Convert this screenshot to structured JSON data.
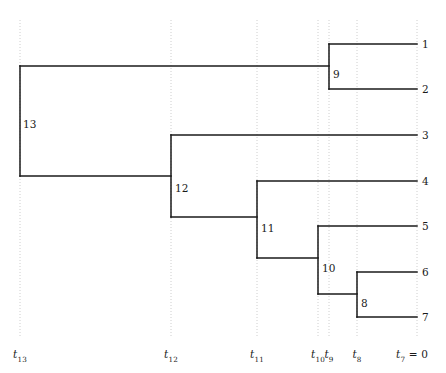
{
  "figure": {
    "type": "phylogenetic-tree",
    "width": 446,
    "height": 373,
    "background_color": "#ffffff",
    "branch_color": "#1a1a1a",
    "gridline_color": "#c8c8c8",
    "text_color": "#1a1a1a"
  },
  "chart_data": {
    "type": "diagram",
    "subtype": "coalescent-phylogenetic-tree",
    "title": "",
    "xlabel": "",
    "ylabel": "",
    "orientation": "left-to-right, time decreasing toward the right",
    "grid": true,
    "legend": false,
    "axis_ticks": [
      {
        "id": "t13",
        "label": "t",
        "sub": "13",
        "extra": "",
        "x": 20
      },
      {
        "id": "t12",
        "label": "t",
        "sub": "12",
        "extra": "",
        "x": 171
      },
      {
        "id": "t11",
        "label": "t",
        "sub": "11",
        "extra": "",
        "x": 257
      },
      {
        "id": "t10",
        "label": "t",
        "sub": "10",
        "extra": "",
        "x": 318
      },
      {
        "id": "t9",
        "label": "t",
        "sub": "9",
        "extra": "",
        "x": 329
      },
      {
        "id": "t8",
        "label": "t",
        "sub": "8",
        "extra": "",
        "x": 357
      },
      {
        "id": "t7",
        "label": "t",
        "sub": "7",
        "extra": " = 0",
        "x": 417
      }
    ],
    "tips": [
      {
        "name": "1",
        "y": 44,
        "parent": "9",
        "x_start": 329,
        "x_end": 417
      },
      {
        "name": "2",
        "y": 89,
        "parent": "9",
        "x_start": 329,
        "x_end": 417
      },
      {
        "name": "3",
        "y": 135,
        "parent": "12",
        "x_start": 171,
        "x_end": 417
      },
      {
        "name": "4",
        "y": 181,
        "parent": "11",
        "x_start": 257,
        "x_end": 417
      },
      {
        "name": "5",
        "y": 226,
        "parent": "10",
        "x_start": 318,
        "x_end": 417
      },
      {
        "name": "6",
        "y": 272,
        "parent": "8",
        "x_start": 357,
        "x_end": 417
      },
      {
        "name": "7",
        "y": 317,
        "parent": "8",
        "x_start": 357,
        "x_end": 417
      }
    ],
    "internal_nodes": [
      {
        "name": "13",
        "time_tick": "t13",
        "x": 20,
        "y_top": 66,
        "y_bottom": 176,
        "children": [
          "9",
          "12"
        ],
        "label_x": 23,
        "label_y": 118
      },
      {
        "name": "12",
        "time_tick": "t12",
        "x": 171,
        "y_top": 135,
        "y_bottom": 217,
        "children": [
          "3",
          "11"
        ],
        "label_x": 175,
        "label_y": 182
      },
      {
        "name": "11",
        "time_tick": "t11",
        "x": 257,
        "y_top": 181,
        "y_bottom": 258,
        "children": [
          "4",
          "10"
        ],
        "label_x": 261,
        "label_y": 222
      },
      {
        "name": "10",
        "time_tick": "t10",
        "x": 318,
        "y_top": 226,
        "y_bottom": 294,
        "children": [
          "5",
          "8"
        ],
        "label_x": 322,
        "label_y": 262
      },
      {
        "name": "9",
        "time_tick": "t9",
        "x": 329,
        "y_top": 44,
        "y_bottom": 89,
        "children": [
          "1",
          "2"
        ],
        "label_x": 333,
        "label_y": 68
      },
      {
        "name": "8",
        "time_tick": "t8",
        "x": 357,
        "y_top": 272,
        "y_bottom": 317,
        "children": [
          "6",
          "7"
        ],
        "label_x": 361,
        "label_y": 297
      }
    ],
    "branches": [
      {
        "from_node": "13",
        "to": "9",
        "y": 66,
        "x_start": 20,
        "x_end": 329
      },
      {
        "from_node": "13",
        "to": "12",
        "y": 176,
        "x_start": 20,
        "x_end": 171
      },
      {
        "from_node": "12",
        "to": "3",
        "y": 135,
        "x_start": 171,
        "x_end": 417
      },
      {
        "from_node": "12",
        "to": "11",
        "y": 217,
        "x_start": 171,
        "x_end": 257
      },
      {
        "from_node": "11",
        "to": "4",
        "y": 181,
        "x_start": 257,
        "x_end": 417
      },
      {
        "from_node": "11",
        "to": "10",
        "y": 258,
        "x_start": 257,
        "x_end": 318
      },
      {
        "from_node": "10",
        "to": "5",
        "y": 226,
        "x_start": 318,
        "x_end": 417
      },
      {
        "from_node": "10",
        "to": "8",
        "y": 294,
        "x_start": 318,
        "x_end": 357
      },
      {
        "from_node": "9",
        "to": "1",
        "y": 44,
        "x_start": 329,
        "x_end": 417
      },
      {
        "from_node": "9",
        "to": "2",
        "y": 89,
        "x_start": 329,
        "x_end": 417
      },
      {
        "from_node": "8",
        "to": "6",
        "y": 272,
        "x_start": 357,
        "x_end": 417
      },
      {
        "from_node": "8",
        "to": "7",
        "y": 317,
        "x_start": 357,
        "x_end": 417
      }
    ],
    "gridlines_y_range": [
      20,
      338
    ],
    "tip_label_x": 422,
    "axis_label_y": 348
  }
}
